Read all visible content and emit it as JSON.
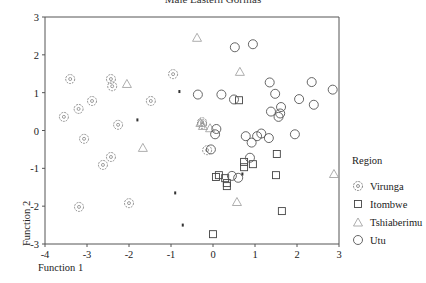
{
  "chart_data": {
    "type": "scatter",
    "title": "Male Eastern Gorillas",
    "xlabel": "Function 1",
    "ylabel": "Function 2",
    "xlim": [
      -4,
      3
    ],
    "ylim": [
      -3,
      3
    ],
    "xticks": [
      -4,
      -3,
      -2,
      -1,
      0,
      1,
      2,
      3
    ],
    "yticks": [
      -3,
      -2,
      -1,
      0,
      1,
      2,
      3
    ],
    "grid": false,
    "legend_position": "right",
    "legend_title": "Region",
    "series": [
      {
        "name": "Virunga",
        "marker": "circle-with-dot",
        "points": [
          [
            -3.4,
            1.36
          ],
          [
            -3.2,
            0.57
          ],
          [
            -3.55,
            0.36
          ],
          [
            -2.88,
            0.78
          ],
          [
            -2.43,
            1.36
          ],
          [
            -2.4,
            1.17
          ],
          [
            -3.07,
            -0.22
          ],
          [
            -2.26,
            0.15
          ],
          [
            -3.19,
            -2.02
          ],
          [
            -2.0,
            -1.92
          ],
          [
            -2.43,
            -0.7
          ],
          [
            -2.62,
            -0.91
          ],
          [
            -1.48,
            0.78
          ],
          [
            -0.95,
            1.49
          ],
          [
            -0.26,
            0.22
          ],
          [
            -0.26,
            0.17
          ],
          [
            -0.14,
            -0.52
          ]
        ]
      },
      {
        "name": "Itombwe",
        "marker": "square",
        "points": [
          [
            0.0,
            -2.74
          ],
          [
            0.14,
            -1.18
          ],
          [
            0.29,
            -1.26
          ],
          [
            0.33,
            -1.39
          ],
          [
            0.07,
            -1.23
          ],
          [
            0.33,
            -1.47
          ],
          [
            0.74,
            -0.83
          ],
          [
            0.74,
            -0.97
          ],
          [
            0.95,
            -0.89
          ],
          [
            1.52,
            -0.62
          ],
          [
            1.5,
            -1.18
          ],
          [
            1.64,
            -2.13
          ],
          [
            0.62,
            0.8
          ]
        ]
      },
      {
        "name": "Tshiaberimu",
        "marker": "triangle",
        "points": [
          [
            -0.38,
            2.45
          ],
          [
            0.64,
            1.55
          ],
          [
            -0.24,
            0.12
          ],
          [
            -0.07,
            0.06
          ],
          [
            0.57,
            -1.89
          ],
          [
            -1.67,
            -0.46
          ],
          [
            -2.05,
            1.23
          ],
          [
            2.88,
            -1.15
          ],
          [
            -0.3,
            0.2
          ]
        ]
      },
      {
        "name": "Utu",
        "marker": "circle",
        "points": [
          [
            0.52,
            2.2
          ],
          [
            0.95,
            2.28
          ],
          [
            -0.36,
            0.95
          ],
          [
            0.5,
            0.82
          ],
          [
            1.35,
            1.27
          ],
          [
            1.48,
            0.97
          ],
          [
            2.35,
            1.28
          ],
          [
            2.85,
            1.08
          ],
          [
            1.38,
            0.5
          ],
          [
            1.6,
            0.45
          ],
          [
            1.62,
            0.62
          ],
          [
            1.56,
            0.36
          ],
          [
            2.05,
            0.83
          ],
          [
            2.4,
            0.68
          ],
          [
            0.2,
            0.95
          ],
          [
            0.08,
            0.04
          ],
          [
            1.15,
            -0.08
          ],
          [
            1.33,
            -0.2
          ],
          [
            1.05,
            -0.15
          ],
          [
            0.92,
            -0.32
          ],
          [
            0.78,
            -0.15
          ],
          [
            1.95,
            -0.1
          ],
          [
            0.05,
            -0.1
          ],
          [
            0.6,
            -1.25
          ],
          [
            0.45,
            -1.2
          ],
          [
            0.88,
            -0.72
          ],
          [
            -0.05,
            -0.5
          ]
        ]
      },
      {
        "name": "unlabeled small markers",
        "marker": "dot",
        "points": [
          [
            -0.8,
            1.03
          ],
          [
            -1.8,
            0.28
          ],
          [
            -0.9,
            -1.65
          ],
          [
            -0.72,
            -2.5
          ],
          [
            0.7,
            -1.15
          ]
        ]
      }
    ]
  },
  "title": "Male Eastern Gorillas",
  "axes": {
    "xlabel": "Function 1",
    "ylabel": "Function 2",
    "xticks": [
      "-4",
      "-3",
      "-2",
      "-1",
      "0",
      "1",
      "2",
      "3"
    ],
    "yticks": [
      "3",
      "2",
      "1",
      "0",
      "-1",
      "-2",
      "-3"
    ]
  },
  "legend": {
    "title": "Region",
    "items": [
      {
        "label": "Virunga",
        "marker": "circle-with-dot"
      },
      {
        "label": "Itombwe",
        "marker": "square"
      },
      {
        "label": "Tshiaberimu",
        "marker": "triangle"
      },
      {
        "label": "Utu",
        "marker": "circle"
      }
    ]
  },
  "colors": {
    "axis": "#555555",
    "marker_stroke": "#555555",
    "background": "#ffffff"
  }
}
